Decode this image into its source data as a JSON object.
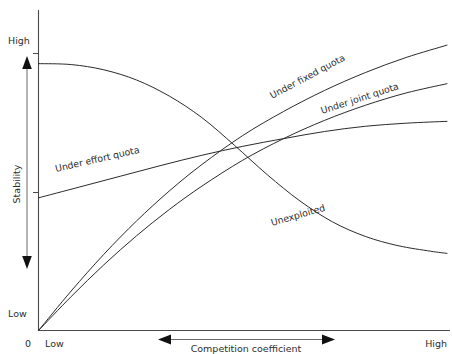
{
  "figure": {
    "background_color": "#ffffff",
    "line_color": "#2b2b2b",
    "axis_color": "#4a4a4a"
  },
  "axes": {
    "y": {
      "title": "Stability",
      "high_label": "High",
      "low_label": "Low",
      "arrow": "double-vertical"
    },
    "x": {
      "title": "Competition coefficient",
      "low_label": "Low",
      "high_label": "High",
      "origin_label": "0",
      "arrow": "double-horizontal"
    }
  },
  "chart_data": {
    "type": "line",
    "title": "",
    "xlabel": "Competition coefficient",
    "ylabel": "Stability",
    "xlim": [
      0,
      1
    ],
    "ylim": [
      0,
      1
    ],
    "xticklabels": [
      "Low",
      "High"
    ],
    "yticklabels": [
      "Low",
      "High"
    ],
    "grid": false,
    "legend": "inline-curve-labels",
    "annotations": [
      "Unexploited",
      "Under effort quota",
      "Under fixed quota",
      "Under joint quota"
    ],
    "series": [
      {
        "name": "Unexploited",
        "label": "Unexploited",
        "label_x": 0.63,
        "label_y": 0.345,
        "description": "Starts at high stability near x=0 and decreases monotonically, falling steeply in the mid range then flattening at low stability.",
        "x": [
          0.0,
          0.08,
          0.16,
          0.24,
          0.32,
          0.4,
          0.48,
          0.56,
          0.64,
          0.72,
          0.8,
          0.88,
          0.96,
          1.0
        ],
        "y": [
          0.865,
          0.862,
          0.845,
          0.812,
          0.76,
          0.69,
          0.6,
          0.505,
          0.42,
          0.352,
          0.305,
          0.275,
          0.257,
          0.25
        ]
      },
      {
        "name": "Under effort quota",
        "label": "Under effort quota",
        "label_x": 0.16,
        "label_y": 0.545,
        "description": "Starts at low-moderate stability and rises gently and nearly linearly, flattening slightly toward high competition.",
        "x": [
          0.0,
          0.1,
          0.2,
          0.3,
          0.4,
          0.5,
          0.6,
          0.7,
          0.8,
          0.9,
          1.0
        ],
        "y": [
          0.43,
          0.465,
          0.5,
          0.535,
          0.568,
          0.597,
          0.622,
          0.645,
          0.662,
          0.672,
          0.678
        ]
      },
      {
        "name": "Under fixed quota",
        "label": "Under fixed quota",
        "label_x": 0.62,
        "label_y": 0.76,
        "description": "Rises steeply from the origin, concave down, reaching the highest stability at high competition.",
        "x": [
          0.0,
          0.08,
          0.16,
          0.24,
          0.32,
          0.4,
          0.5,
          0.6,
          0.7,
          0.8,
          0.9,
          1.0
        ],
        "y": [
          0.0,
          0.128,
          0.247,
          0.355,
          0.452,
          0.538,
          0.632,
          0.71,
          0.778,
          0.836,
          0.885,
          0.925
        ]
      },
      {
        "name": "Under joint quota",
        "label": "Under joint quota",
        "label_x": 0.8,
        "label_y": 0.7,
        "description": "Rises from the origin slightly below the fixed-quota curve, concave down, ending at intermediate-high stability.",
        "x": [
          0.0,
          0.08,
          0.16,
          0.24,
          0.32,
          0.4,
          0.5,
          0.6,
          0.7,
          0.8,
          0.9,
          1.0
        ],
        "y": [
          0.0,
          0.11,
          0.213,
          0.307,
          0.392,
          0.468,
          0.552,
          0.622,
          0.681,
          0.73,
          0.77,
          0.8
        ]
      }
    ]
  }
}
